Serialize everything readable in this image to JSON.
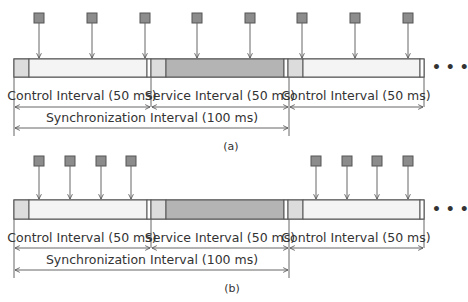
{
  "diagrams": [
    {
      "caption": "(a)",
      "intervals": [
        {
          "label": "Control Interval (50 ms)",
          "type": "control"
        },
        {
          "label": "Service Interval (50 ms)",
          "type": "service"
        },
        {
          "label": "Control Interval (50 ms)",
          "type": "control"
        }
      ],
      "sync_label": "Synchronization Interval (100 ms)",
      "packet_x": [
        39,
        92,
        145,
        197,
        250,
        302,
        355,
        408
      ]
    },
    {
      "caption": "(b)",
      "intervals": [
        {
          "label": "Control Interval (50 ms)",
          "type": "control"
        },
        {
          "label": "Service Interval (50 ms)",
          "type": "service"
        },
        {
          "label": "Control Interval (50 ms)",
          "type": "control"
        }
      ],
      "sync_label": "Synchronization Interval (100 ms)",
      "packet_x": [
        39,
        70,
        101,
        131,
        316,
        347,
        377,
        408
      ]
    }
  ],
  "continuation": "• • •",
  "colors": {
    "packet_fill": "#8c8c8c",
    "packet_stroke": "#555555",
    "guard_fill": "#dcdcdc",
    "control_fill": "#f4f4f4",
    "service_fill": "#b4b4b4",
    "outline": "#555555",
    "arrow": "#666666"
  }
}
